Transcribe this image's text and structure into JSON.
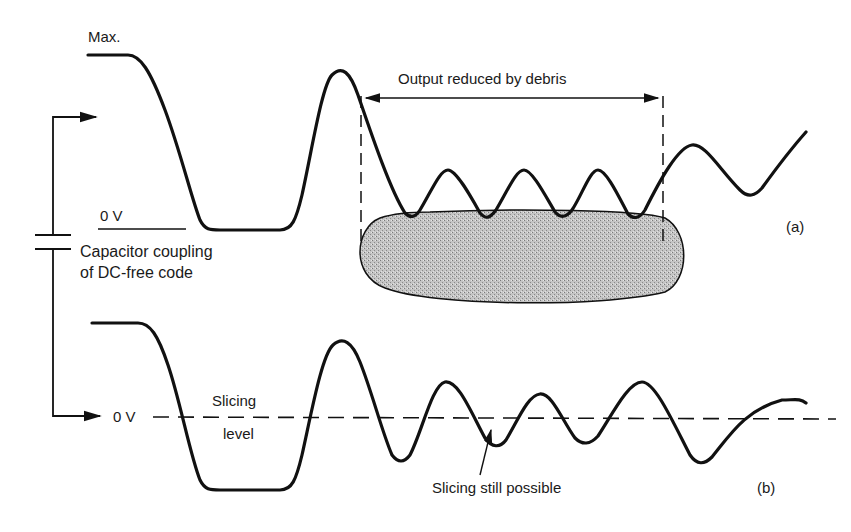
{
  "diagram": {
    "type": "waveform-comparison",
    "labels": {
      "max": "Max.",
      "zero_v_a": "0 V",
      "zero_v_b": "0 V",
      "capacitor": "Capacitor coupling of DC-free code",
      "output_reduced": "Output reduced by debris",
      "slicing_level_1": "Slicing",
      "slicing_level_2": "level",
      "slicing_possible": "Slicing still possible",
      "panel_a": "(a)",
      "panel_b": "(b)"
    },
    "panels": [
      {
        "id": "a",
        "description": "Waveform referenced to 0 V with debris region reducing output amplitude"
      },
      {
        "id": "b",
        "description": "Same waveform after capacitor coupling, centered on 0 V slicing level"
      }
    ],
    "colors": {
      "line": "#111111",
      "debris_fill": "#b8b8b8",
      "background": "#ffffff"
    }
  }
}
